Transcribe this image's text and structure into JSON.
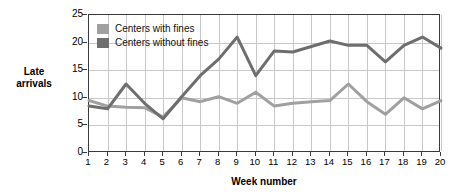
{
  "chart_data": {
    "type": "line",
    "title": "",
    "xlabel": "Week number",
    "ylabel": "Late arrivals",
    "ylabel_lines": [
      "Late",
      "arrivals"
    ],
    "x": [
      1,
      2,
      3,
      4,
      5,
      6,
      7,
      8,
      9,
      10,
      11,
      12,
      13,
      14,
      15,
      16,
      17,
      18,
      19,
      20
    ],
    "xtick_labels": [
      "1",
      "2",
      "3",
      "4",
      "5",
      "6",
      "7",
      "8",
      "9",
      "10",
      "11",
      "12",
      "13",
      "14",
      "15",
      "16",
      "17",
      "18",
      "19",
      "20"
    ],
    "ytick_labels": [
      "0",
      "5",
      "10",
      "15",
      "20",
      "25"
    ],
    "yticks": [
      0,
      5,
      10,
      15,
      20,
      25
    ],
    "ylim": [
      0,
      25
    ],
    "xlim": [
      1,
      20
    ],
    "grid": true,
    "legend_position": "top-left",
    "series": [
      {
        "name": "Centers with fines",
        "color": "#a0a0a0",
        "values": [
          9.5,
          8.5,
          8.3,
          8.2,
          6.5,
          10.0,
          9.3,
          10.2,
          9.0,
          11.0,
          8.5,
          9.0,
          9.3,
          9.5,
          12.5,
          9.3,
          7.0,
          10.0,
          8.0,
          9.5
        ]
      },
      {
        "name": "Centers without fines",
        "color": "#6e6e6e",
        "values": [
          8.5,
          8.0,
          12.5,
          9.0,
          6.2,
          10.2,
          14.0,
          17.0,
          21.0,
          14.0,
          18.5,
          18.3,
          19.3,
          20.3,
          19.5,
          19.5,
          16.5,
          19.5,
          21.0,
          19.0
        ]
      }
    ]
  },
  "legend": {
    "items": [
      {
        "label": "Centers with fines",
        "color": "#a0a0a0"
      },
      {
        "label": "Centers without fines",
        "color": "#6e6e6e"
      }
    ]
  }
}
